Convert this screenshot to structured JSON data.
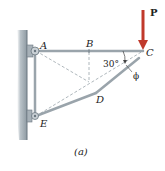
{
  "figure": {
    "caption": "(a)",
    "points": {
      "A": "A",
      "B": "B",
      "C": "C",
      "D": "D",
      "E": "E"
    },
    "load_label": "P",
    "angle_label": "30°",
    "phi_label": "ϕ",
    "colors": {
      "member": "#9aa4ab",
      "wall": "#8c98a0",
      "load_arrow": "#c0392b",
      "dashed": "#9aa4ab"
    }
  }
}
